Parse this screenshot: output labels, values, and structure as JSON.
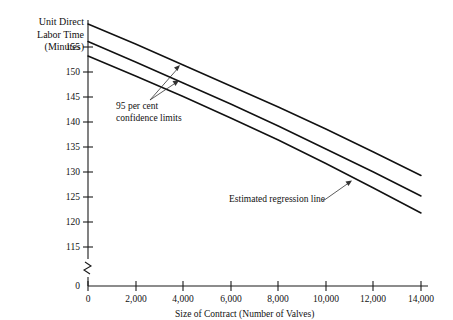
{
  "chart_data": {
    "type": "line",
    "title": "",
    "ylabel_lines": [
      "Unit Direct",
      "Labor Time",
      "(Minutes)"
    ],
    "ylabel": "Unit Direct Labor Time (Minutes)",
    "xlabel": "Size of Contract (Number of Valves)",
    "grid": false,
    "legend_position": "none",
    "x": [
      0,
      2000,
      4000,
      6000,
      8000,
      10000,
      12000,
      14000
    ],
    "xtick_labels": [
      "0",
      "2,000",
      "4,000",
      "6,000",
      "8,000",
      "10,000",
      "12,000",
      "14,000"
    ],
    "xlim": [
      0,
      14000
    ],
    "ytick_labels": [
      "0",
      "115",
      "120",
      "125",
      "130",
      "135",
      "140",
      "145",
      "150",
      "155"
    ],
    "y_ticks": [
      115,
      120,
      125,
      130,
      135,
      140,
      145,
      150,
      155
    ],
    "ylim": [
      113.5,
      160.5
    ],
    "y_axis_break": true,
    "y_axis_break_note": "axis broken between 0 and 115",
    "series": [
      {
        "name": "Upper 95 per cent confidence limit",
        "values": [
          159.6,
          155.6,
          151.4,
          147.2,
          143.0,
          138.6,
          134.0,
          129.3
        ]
      },
      {
        "name": "Estimated regression line",
        "values": [
          156.1,
          152.0,
          147.8,
          143.6,
          139.2,
          134.6,
          130.0,
          125.2
        ]
      },
      {
        "name": "Lower 95 per cent confidence limit",
        "values": [
          153.2,
          149.2,
          145.1,
          140.8,
          136.4,
          131.7,
          126.8,
          121.8
        ]
      }
    ],
    "annotations": [
      {
        "id": "confidence-limits",
        "lines": [
          "95 per cent",
          "confidence limits"
        ],
        "text": "95 per cent confidence limits",
        "points_to": [
          "Upper 95 per cent confidence limit",
          "Lower 95 per cent confidence limit"
        ]
      },
      {
        "id": "regression-line",
        "lines": [
          "Estimated regression line"
        ],
        "text": "Estimated regression line",
        "points_to": [
          "Estimated regression line"
        ]
      }
    ],
    "colors": {
      "line": "#111111",
      "axis": "#1a1a1a",
      "background": "#ffffff",
      "annotation": "#333333"
    }
  }
}
